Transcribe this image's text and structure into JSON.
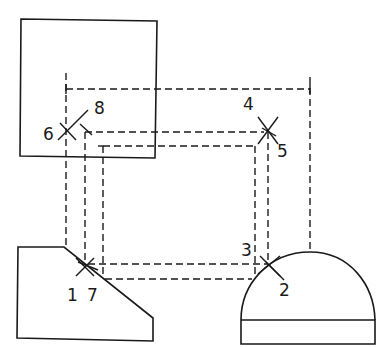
{
  "diagram": {
    "colors": {
      "line": "#1a1a1a",
      "background": "#ffffff"
    },
    "labels": {
      "p1": "1",
      "p2": "2",
      "p3": "3",
      "p4": "4",
      "p5": "5",
      "p6": "6",
      "p7": "7",
      "p8": "8"
    },
    "shapes": [
      {
        "name": "top-view-square"
      },
      {
        "name": "chamfered-block"
      },
      {
        "name": "dome-with-base"
      }
    ]
  }
}
